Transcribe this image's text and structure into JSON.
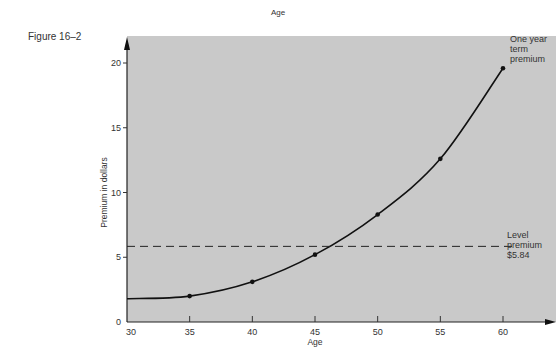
{
  "header": {
    "top_label": "Age",
    "figure_label": "Figure 16–2"
  },
  "chart_data": {
    "type": "line",
    "title": "",
    "xlabel": "Age",
    "ylabel": "Premium in dollars",
    "x": [
      35,
      40,
      45,
      50,
      55,
      60
    ],
    "series": [
      {
        "name": "One year term premium",
        "values": [
          2.0,
          3.1,
          5.2,
          8.3,
          12.6,
          19.6
        ],
        "style": "solid",
        "markers": true,
        "curve_starts_at": {
          "x": 30,
          "y": 1.8
        }
      },
      {
        "name": "Level premium $5.84",
        "values": [
          5.84,
          5.84,
          5.84,
          5.84,
          5.84,
          5.84
        ],
        "style": "dashed",
        "markers": false
      }
    ],
    "xticks": [
      "30",
      "35",
      "40",
      "45",
      "50",
      "55",
      "60"
    ],
    "yticks": [
      "0",
      "5",
      "10",
      "15",
      "20"
    ],
    "xlim": [
      30,
      63
    ],
    "ylim": [
      0,
      21.5
    ],
    "grid": false,
    "background": "#c8c8c8",
    "annotations": [
      {
        "text": [
          "One year",
          "term",
          "premium"
        ],
        "anchor_x": 60,
        "anchor_y": 19.6
      },
      {
        "text": [
          "Level",
          "premium",
          "$5.84"
        ],
        "anchor_x": 61,
        "anchor_y": 5.84
      }
    ]
  }
}
